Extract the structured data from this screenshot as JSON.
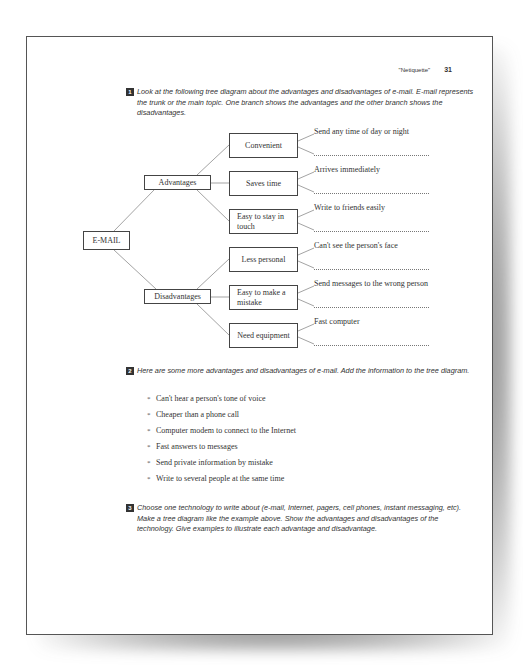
{
  "header": {
    "chapter_title": "\"Netiquette\"",
    "page_number": "31"
  },
  "sections": [
    {
      "number": "1",
      "text": "Look at the following tree diagram about the advantages and disadvantages of e-mail. E-mail represents the trunk or the main topic.  One branch shows the advantages and the other branch shows the disadvantages."
    },
    {
      "number": "2",
      "text": "Here are some more advantages and disadvantages of e-mail.  Add the information to the tree diagram.",
      "items": [
        "Can't hear a person's tone of voice",
        "Cheaper than a phone call",
        "Computer modem to connect to the Internet",
        "Fast answers to messages",
        "Send private information by mistake",
        "Write to several people at the same time"
      ]
    },
    {
      "number": "3",
      "text": "Choose one technology to write about (e-mail, Internet, pagers, cell phones, instant messaging, etc).  Make a tree diagram like the example above.  Show the advantages and disadvantages of the technology.  Give examples to illustrate each advantage and disadvantage."
    }
  ],
  "tree": {
    "root": "E-MAIL",
    "branches": [
      {
        "label": "Advantages",
        "children": [
          {
            "label": "Convenient",
            "example": "Send any time of day or night"
          },
          {
            "label": "Saves time",
            "example": "Arrives immediately"
          },
          {
            "label": "Easy to stay in touch",
            "example": "Write to friends easily"
          }
        ]
      },
      {
        "label": "Disadvantages",
        "children": [
          {
            "label": "Less personal",
            "example": "Can't see the person's face"
          },
          {
            "label": "Easy to make a mistake",
            "example": "Send messages to the wrong person"
          },
          {
            "label": "Need equipment",
            "example": "Fast computer"
          }
        ]
      }
    ]
  },
  "bullet_glyph": "*"
}
